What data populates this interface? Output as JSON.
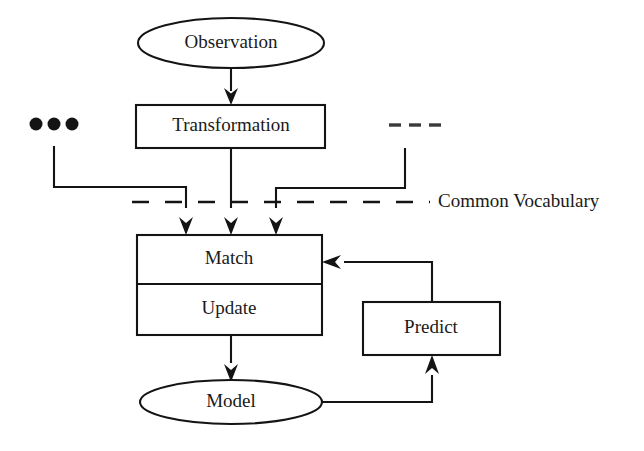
{
  "diagram": {
    "colors": {
      "background": "#ffffff",
      "stroke": "#141414",
      "text": "#1a1a1a",
      "ellipsis_dash": "#3a3a3a"
    },
    "nodes": {
      "observation": {
        "label": "Observation",
        "shape": "ellipse"
      },
      "transformation": {
        "label": "Transformation",
        "shape": "rectangle"
      },
      "match": {
        "label": "Match",
        "shape": "rectangle"
      },
      "update": {
        "label": "Update",
        "shape": "rectangle"
      },
      "model": {
        "label": "Model",
        "shape": "ellipse"
      },
      "predict": {
        "label": "Predict",
        "shape": "rectangle"
      }
    },
    "annotations": {
      "common_vocabulary": {
        "label": "Common Vocabulary",
        "line_style": "dashed"
      },
      "left_ellipsis": {
        "label": "• • •",
        "glyph": "three-dots"
      },
      "right_ellipsis": {
        "label": "- - -",
        "glyph": "three-dashes"
      }
    },
    "edges": [
      {
        "from": "observation",
        "to": "transformation",
        "style": "solid-arrow"
      },
      {
        "from": "transformation",
        "to": "match",
        "style": "solid-arrow"
      },
      {
        "from": "left_ellipsis",
        "to": "match",
        "style": "solid-arrow"
      },
      {
        "from": "right_ellipsis",
        "to": "match",
        "style": "solid-arrow"
      },
      {
        "from": "update",
        "to": "model",
        "style": "solid-arrow"
      },
      {
        "from": "model",
        "to": "predict",
        "style": "solid-arrow"
      },
      {
        "from": "predict",
        "to": "match",
        "style": "solid-arrow"
      }
    ]
  }
}
